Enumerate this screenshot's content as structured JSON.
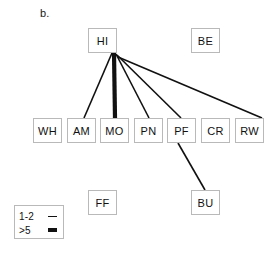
{
  "figure": {
    "panel_label": "b.",
    "background_color": "#ffffff",
    "line_color": "#111111",
    "node_border_color": "#b9b9b9",
    "width": 280,
    "height": 253
  },
  "nodes": [
    {
      "id": "HI",
      "label": "HI",
      "x": 88,
      "y": 28,
      "row": "top"
    },
    {
      "id": "BE",
      "label": "BE",
      "x": 191,
      "y": 28,
      "row": "top"
    },
    {
      "id": "WH",
      "label": "WH",
      "x": 33,
      "y": 118,
      "row": "middle"
    },
    {
      "id": "AM",
      "label": "AM",
      "x": 67,
      "y": 118,
      "row": "middle"
    },
    {
      "id": "MO",
      "label": "MO",
      "x": 100,
      "y": 118,
      "row": "middle"
    },
    {
      "id": "PN",
      "label": "PN",
      "x": 134,
      "y": 118,
      "row": "middle"
    },
    {
      "id": "PF",
      "label": "PF",
      "x": 167,
      "y": 118,
      "row": "middle"
    },
    {
      "id": "CR",
      "label": "CR",
      "x": 201,
      "y": 118,
      "row": "middle"
    },
    {
      "id": "RW",
      "label": "RW",
      "x": 235,
      "y": 118,
      "row": "middle"
    },
    {
      "id": "FF",
      "label": "FF",
      "x": 88,
      "y": 190,
      "row": "bottom"
    },
    {
      "id": "BU",
      "label": "BU",
      "x": 191,
      "y": 190,
      "row": "bottom"
    }
  ],
  "edges": [
    {
      "from": "HI",
      "to": "AM",
      "weight_class": "1-2",
      "width": 1.6,
      "x1": 112,
      "y1": 53,
      "x2": 84,
      "y2": 118
    },
    {
      "from": "HI",
      "to": "MO",
      "weight_class": ">5",
      "width": 4.2,
      "x1": 114,
      "y1": 53,
      "x2": 115,
      "y2": 118
    },
    {
      "from": "HI",
      "to": "PN",
      "weight_class": "1-2",
      "width": 1.6,
      "x1": 116,
      "y1": 54,
      "x2": 149,
      "y2": 118
    },
    {
      "from": "HI",
      "to": "PF",
      "weight_class": "1-2",
      "width": 1.6,
      "x1": 117,
      "y1": 55,
      "x2": 181,
      "y2": 118
    },
    {
      "from": "HI",
      "to": "RW",
      "weight_class": "1-2",
      "width": 1.6,
      "x1": 118,
      "y1": 57,
      "x2": 262,
      "y2": 118
    },
    {
      "from": "PF",
      "to": "BU",
      "weight_class": "1-2",
      "width": 1.6,
      "x1": 178,
      "y1": 143,
      "x2": 205,
      "y2": 190
    }
  ],
  "legend": {
    "rows": [
      {
        "label": "1-2",
        "style": "thin"
      },
      {
        "label": ">5",
        "style": "thick"
      }
    ]
  }
}
